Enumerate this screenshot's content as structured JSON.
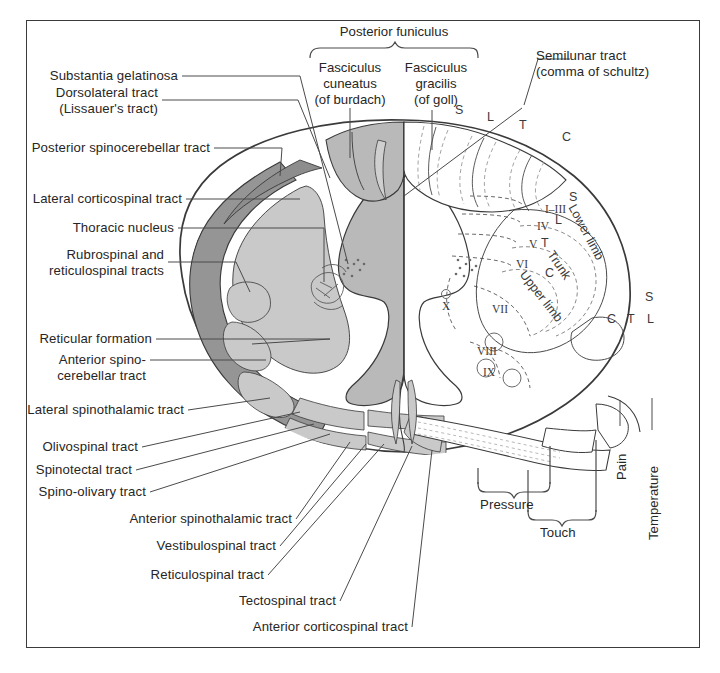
{
  "figure": {
    "background": "#ffffff",
    "frame_color": "#3b3b3b"
  },
  "colors": {
    "outline": "#3a3a3a",
    "gray_matter": "#b9b9b9",
    "light_tract": "#c9c9c9",
    "dark_tract": "#959595",
    "dashed": "#9a9a9a",
    "leader": "#4a4a4a"
  },
  "top_labels": {
    "posterior_funiculus": "Posterior funiculus",
    "fasciculus_cuneatus": "Fasciculus\ncuneatus\n(of burdach)",
    "fasciculus_gracilis": "Fasciculus\ngracilis\n(of goll)",
    "semilunar_tract": "Semilunar tract\n(comma of schultz)"
  },
  "left_labels": [
    {
      "id": "substantia-gelatinosa",
      "text": "Substantia gelatinosa"
    },
    {
      "id": "dorsolateral-tract",
      "text": "Dorsolateral tract\n(Lissauer's tract)"
    },
    {
      "id": "posterior-spinocerebellar",
      "text": "Posterior spinocerebellar tract"
    },
    {
      "id": "lateral-corticospinal",
      "text": "Lateral corticospinal tract"
    },
    {
      "id": "thoracic-nucleus",
      "text": "Thoracic nucleus"
    },
    {
      "id": "rubrospinal-reticulospinal",
      "text": "Rubrospinal and\nreticulospinal tracts"
    },
    {
      "id": "reticular-formation",
      "text": "Reticular formation"
    },
    {
      "id": "anterior-spinocerebellar",
      "text": "Anterior spino-\ncerebellar tract"
    },
    {
      "id": "lateral-spinothalamic",
      "text": "Lateral spinothalamic tract"
    },
    {
      "id": "olivospinal-tract",
      "text": "Olivospinal tract"
    },
    {
      "id": "spinotectal-tract",
      "text": "Spinotectal tract"
    },
    {
      "id": "spino-olivary-tract",
      "text": "Spino-olivary tract"
    },
    {
      "id": "anterior-spinothalamic",
      "text": "Anterior spinothalamic tract"
    },
    {
      "id": "vestibulospinal-tract",
      "text": "Vestibulospinal tract"
    },
    {
      "id": "reticulospinal-tract",
      "text": "Reticulospinal tract"
    },
    {
      "id": "tectospinal-tract",
      "text": "Tectospinal tract"
    },
    {
      "id": "anterior-corticospinal",
      "text": "Anterior corticospinal tract"
    }
  ],
  "bottom_labels": {
    "pressure": "Pressure",
    "touch": "Touch",
    "pain": "Pain",
    "temperature": "Temperature"
  },
  "posterior_funiculus_segments": [
    "S",
    "L",
    "T",
    "C"
  ],
  "laminae": [
    "I–III",
    "IV",
    "V",
    "VI",
    "VII",
    "VIII",
    "IX",
    "X"
  ],
  "somatotopy": {
    "regions": [
      "Lower limb",
      "Trunk",
      "Upper limb"
    ],
    "corticospinal_inner": [
      "S",
      "L",
      "T",
      "C"
    ],
    "spinothalamic_outer": [
      "S",
      "C",
      "T",
      "L"
    ]
  }
}
